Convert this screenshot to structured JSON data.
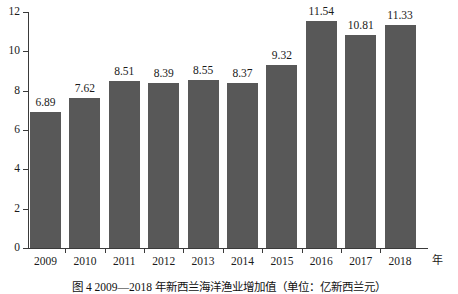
{
  "chart_data": {
    "type": "bar",
    "title": "",
    "caption": "图 4    2009—2018 年新西兰海洋渔业增加值（单位：亿新西兰元）",
    "categories": [
      "2009",
      "2010",
      "2011",
      "2012",
      "2013",
      "2014",
      "2015",
      "2016",
      "2017",
      "2018"
    ],
    "values": [
      6.89,
      7.62,
      8.51,
      8.39,
      8.55,
      8.37,
      9.32,
      11.54,
      10.81,
      11.33
    ],
    "value_labels": [
      "6.89",
      "7.62",
      "8.51",
      "8.39",
      "8.55",
      "8.37",
      "9.32",
      "11.54",
      "10.81",
      "11.33"
    ],
    "xlabel": "年",
    "ylabel": "",
    "ylim": [
      0,
      12
    ],
    "yticks": [
      0,
      2,
      4,
      6,
      8,
      10,
      12
    ],
    "ytick_labels": [
      "0",
      "2",
      "4",
      "6",
      "8",
      "10",
      "12"
    ],
    "grid": false,
    "legend": null,
    "bar_color": "#585858",
    "axis_color": "#3a3a3a",
    "background": "#ffffff"
  }
}
